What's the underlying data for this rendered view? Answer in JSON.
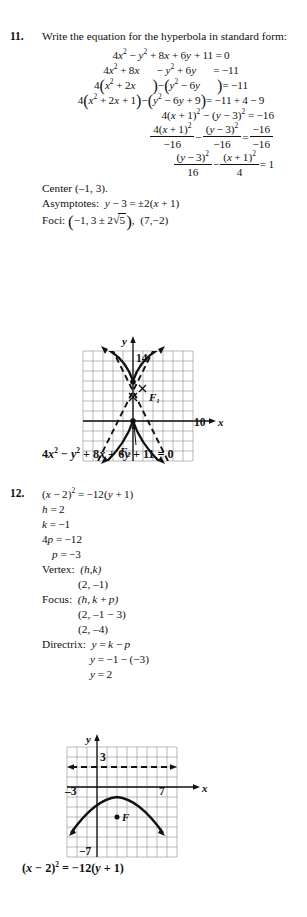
{
  "page": {
    "width": 307,
    "height": 917,
    "background": "#ffffff",
    "ink": "#111111"
  },
  "problems": [
    {
      "number": "11.",
      "prompt": "Write the equation for the hyperbola in standard form:",
      "steps": [
        "4x² − y² + 8x + 6y + 11 = 0",
        "4x² + 8x      − y² + 6y      = −11",
        "4(x² + 2x      ) − (y² − 6y      ) = −11",
        "4(x² + 2x + 1) − (y² − 6y + 9) = −11 + 4 − 9",
        "4(x + 1)² − (y − 3)² = −16",
        "4(x + 1)² / −16 − (y − 3)² / −16 = −16 / −16",
        "(y − 3)² / 16 − (x + 1)² / 4 = 1"
      ],
      "center_label": "Center",
      "center_value": "(–1, 3).",
      "asymptotes_label": "Asymptotes:",
      "asymptotes_value": "y − 3 = ±2(x + 1)",
      "foci_label": "Foci:",
      "foci_value_1": "(–1, 3 ± 2√5)",
      "foci_value_2": "(7, –2)",
      "answer": "4x² − y² + 8x + 6y + 11 = 0",
      "graph": {
        "type": "hyperbola-graph",
        "x_axis_label": "x",
        "y_axis_label": "y",
        "x_tick_label": "10",
        "y_tick_label": "14",
        "focus_labels": [
          "F₁",
          "F₂"
        ],
        "grid_cols": 11,
        "grid_rows": 11,
        "has_dashed_asymptotes": true,
        "vertices_marked": 2
      }
    },
    {
      "number": "12.",
      "steps": [
        "(x − 2)² = −12(y + 1)",
        "h = 2",
        "k = –1",
        "4p = −12",
        "p = –3"
      ],
      "vertex_label": "Vertex:",
      "vertex_formula": "(h, k)",
      "vertex_value": "(2, –1)",
      "focus_label": "Focus:",
      "focus_formula": "(h, k + p)",
      "focus_value_1": "(2, –1 − 3)",
      "focus_value_2": "(2, –4)",
      "directrix_label": "Directrix:",
      "directrix_formula": "y = k − p",
      "directrix_value_1": "y = –1 − (–3)",
      "directrix_value_2": "y = 2",
      "answer": "(x − 2)² = −12(y + 1)",
      "graph": {
        "type": "parabola-graph",
        "x_axis_label": "x",
        "y_axis_label": "y",
        "x_tick_label_left": "–3",
        "x_tick_label_right": "7",
        "y_tick_label_top": "3",
        "y_tick_label_bottom": "−7",
        "focus_label": "F",
        "grid_cols": 11,
        "grid_rows": 11,
        "has_dashed_directrix": true
      }
    }
  ]
}
